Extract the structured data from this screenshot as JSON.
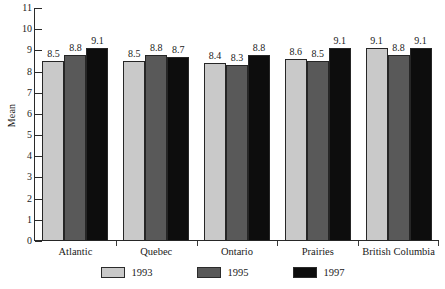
{
  "chart_data": {
    "type": "bar",
    "title": "",
    "xlabel": "",
    "ylabel": "Mean",
    "ylim": [
      0,
      11
    ],
    "yticks": [
      0,
      1,
      2,
      3,
      4,
      5,
      6,
      7,
      8,
      9,
      10,
      11
    ],
    "grid": false,
    "legend_position": "bottom",
    "categories": [
      "Atlantic",
      "Quebec",
      "Ontario",
      "Prairies",
      "British Columbia"
    ],
    "series": [
      {
        "name": "1993",
        "color": "#c9c9c9",
        "values": [
          8.5,
          8.5,
          8.4,
          8.6,
          9.1
        ]
      },
      {
        "name": "1995",
        "color": "#595959",
        "values": [
          8.8,
          8.8,
          8.3,
          8.5,
          8.8
        ]
      },
      {
        "name": "1997",
        "color": "#0d0d0d",
        "values": [
          9.1,
          8.7,
          8.8,
          9.1,
          9.1
        ]
      }
    ]
  }
}
